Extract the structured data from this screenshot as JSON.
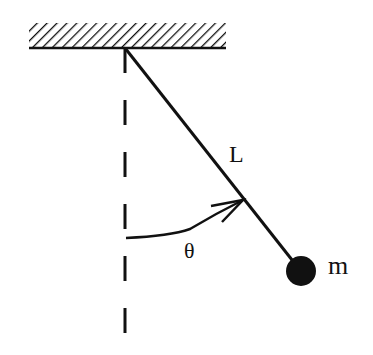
{
  "diagram": {
    "labels": {
      "length": "L",
      "angle": "θ",
      "mass": "m"
    },
    "colors": {
      "ink": "#111111",
      "background": "#ffffff"
    }
  }
}
